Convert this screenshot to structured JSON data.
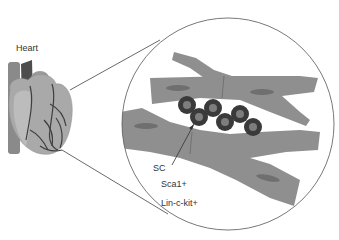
{
  "labels": {
    "heart": "Heart",
    "sc": "SC",
    "sca1": "Sca1+",
    "lin_ckit": "Lin-c-kit+"
  },
  "colors": {
    "background": "#ffffff",
    "muscle": "#8f8f8f",
    "nucleus": "#6f6f6f",
    "stem_cell_outer": "#3a3a3a",
    "stem_cell_inner": "#7d7d7d",
    "heart_body": "#a8a8a8",
    "heart_dark": "#4a4a4a",
    "line": "#444444"
  }
}
